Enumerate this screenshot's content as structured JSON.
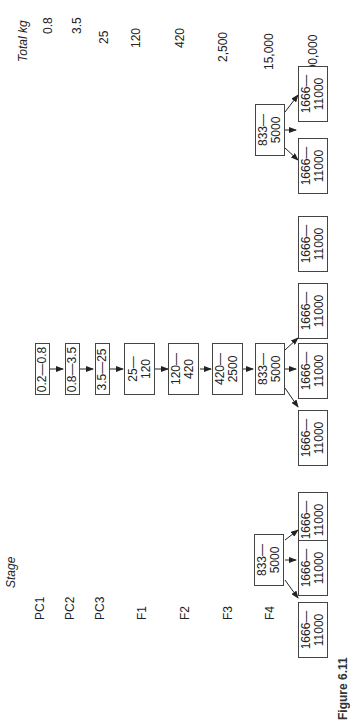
{
  "headers": {
    "stage": "Stage",
    "total": "Total kg"
  },
  "stages": [
    {
      "label": "PC1",
      "total": "0.8"
    },
    {
      "label": "PC2",
      "total": "3.5"
    },
    {
      "label": "PC3",
      "total": "25"
    },
    {
      "label": "F1",
      "total": "120"
    },
    {
      "label": "F2",
      "total": "420"
    },
    {
      "label": "F3",
      "total": "2,500"
    },
    {
      "label": "F4",
      "total": "15,000"
    },
    {
      "label": "F5",
      "total": "100,000"
    }
  ],
  "boxes": {
    "pc1": "0.2—0.8",
    "pc2": "0.8—3.5",
    "pc3": "3.5—25",
    "f1": [
      "25—",
      "120"
    ],
    "f2": [
      "120—",
      "420"
    ],
    "f3": [
      "420—",
      "2500"
    ],
    "f4": [
      "833—",
      "5000"
    ],
    "f5": [
      "1666—",
      "11000"
    ]
  },
  "caption": "Figure 6.11"
}
